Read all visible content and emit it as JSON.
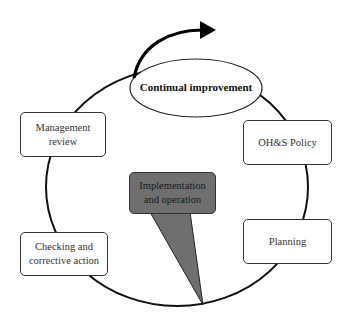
{
  "diagram": {
    "center_label": "Continual improvement",
    "nodes": {
      "management_review": "Management review",
      "ohs_policy": "OH&S Policy",
      "implementation": "Implementation and operation",
      "checking": "Checking and corrective action",
      "planning": "Planning"
    },
    "colors": {
      "line": "#111111",
      "implementation_fill": "#6f6f6f",
      "box_fill": "#ffffff"
    }
  }
}
